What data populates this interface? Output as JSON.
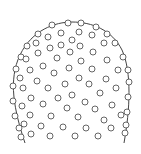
{
  "diagram": {
    "width": 141,
    "height": 154,
    "background": "#ffffff",
    "stroke_color": "#444444",
    "circle_stroke_color": "#555555",
    "circle_radius": 3,
    "outline": {
      "description": "dome-shaped arch outline",
      "path": "M 25 143 C 14 110, 8 80, 20 55 C 32 30, 55 22, 72 22 C 92 22, 112 30, 122 50 C 132 72, 130 110, 124 143"
    },
    "edge_circles": [
      [
        52,
        25
      ],
      [
        68,
        23
      ],
      [
        81,
        23
      ],
      [
        96,
        27
      ],
      [
        107,
        34
      ],
      [
        115,
        43
      ],
      [
        123,
        57
      ],
      [
        38,
        34
      ],
      [
        27,
        46
      ],
      [
        21,
        57
      ],
      [
        16,
        69
      ],
      [
        13,
        86
      ],
      [
        13,
        101
      ],
      [
        15,
        116
      ],
      [
        19,
        128
      ],
      [
        21,
        137
      ],
      [
        128,
        70
      ],
      [
        129,
        82
      ],
      [
        128,
        97
      ],
      [
        127,
        112
      ],
      [
        126,
        125
      ],
      [
        125,
        133
      ]
    ],
    "interior_circles": [
      [
        48,
        37
      ],
      [
        61,
        33
      ],
      [
        79,
        32
      ],
      [
        92,
        35
      ],
      [
        72,
        40
      ],
      [
        36,
        43
      ],
      [
        50,
        48
      ],
      [
        61,
        45
      ],
      [
        80,
        46
      ],
      [
        104,
        43
      ],
      [
        38,
        53
      ],
      [
        70,
        52
      ],
      [
        93,
        52
      ],
      [
        26,
        59
      ],
      [
        57,
        58
      ],
      [
        81,
        61
      ],
      [
        107,
        60
      ],
      [
        30,
        70
      ],
      [
        43,
        66
      ],
      [
        54,
        73
      ],
      [
        69,
        68
      ],
      [
        92,
        69
      ],
      [
        118,
        70
      ],
      [
        20,
        78
      ],
      [
        37,
        81
      ],
      [
        79,
        78
      ],
      [
        106,
        79
      ],
      [
        65,
        84
      ],
      [
        89,
        84
      ],
      [
        48,
        88
      ],
      [
        23,
        88
      ],
      [
        116,
        88
      ],
      [
        31,
        98
      ],
      [
        58,
        98
      ],
      [
        72,
        95
      ],
      [
        100,
        93
      ],
      [
        43,
        104
      ],
      [
        85,
        102
      ],
      [
        112,
        105
      ],
      [
        22,
        106
      ],
      [
        67,
        108
      ],
      [
        95,
        109
      ],
      [
        30,
        115
      ],
      [
        51,
        116
      ],
      [
        78,
        117
      ],
      [
        121,
        115
      ],
      [
        104,
        120
      ],
      [
        24,
        124
      ],
      [
        41,
        126
      ],
      [
        63,
        127
      ],
      [
        86,
        128
      ],
      [
        111,
        128
      ],
      [
        31,
        134
      ],
      [
        50,
        136
      ],
      [
        75,
        136
      ],
      [
        98,
        136
      ]
    ]
  }
}
